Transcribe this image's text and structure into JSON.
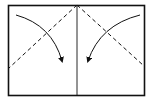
{
  "diagram": {
    "type": "origami-fold-instruction",
    "colors": {
      "line": "#111111",
      "background": "#ffffff"
    },
    "paper": {
      "x": 8,
      "y": 5,
      "width": 137,
      "height": 91
    },
    "center_crease": {
      "x": 77,
      "y1": 5,
      "y2": 96,
      "style": "solid"
    },
    "fold_lines": [
      {
        "name": "left-valley-fold",
        "x1": 77,
        "y1": 5,
        "x2": 9,
        "y2": 68,
        "style": "dashed"
      },
      {
        "name": "right-valley-fold",
        "x1": 77,
        "y1": 5,
        "x2": 144,
        "y2": 66,
        "style": "dashed"
      }
    ],
    "arrows": [
      {
        "name": "left-fold-arrow",
        "from": [
          16,
          15
        ],
        "to": [
          62,
          62
        ],
        "direction": "down-right"
      },
      {
        "name": "right-fold-arrow",
        "from": [
          140,
          15
        ],
        "to": [
          88,
          62
        ],
        "direction": "down-left"
      }
    ]
  }
}
